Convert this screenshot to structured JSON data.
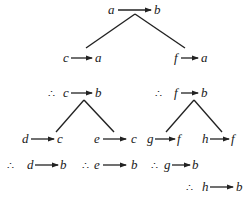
{
  "diagram": {
    "type": "inference-tree",
    "therefore_symbol": "∴",
    "nodes": [
      {
        "id": "root",
        "from": "a",
        "to": "b",
        "x": 118,
        "y": 14
      },
      {
        "id": "c_a",
        "from": "c",
        "to": "a",
        "x": 63,
        "y": 62
      },
      {
        "id": "f_a",
        "from": "f",
        "to": "a",
        "x": 174,
        "y": 62
      },
      {
        "id": "c_b",
        "from": "c",
        "to": "b",
        "x": 64,
        "y": 96,
        "therefore": true
      },
      {
        "id": "f_b",
        "from": "f",
        "to": "b",
        "x": 174,
        "y": 96,
        "therefore": true
      },
      {
        "id": "d_c",
        "from": "d",
        "to": "c",
        "x": 24,
        "y": 141
      },
      {
        "id": "e_c",
        "from": "e",
        "to": "c",
        "x": 93,
        "y": 141
      },
      {
        "id": "g_f",
        "from": "g",
        "to": "f",
        "x": 148,
        "y": 141
      },
      {
        "id": "h_f",
        "from": "h",
        "to": "f",
        "x": 203,
        "y": 141
      },
      {
        "id": "d_b",
        "from": "d",
        "to": "b",
        "x": 28,
        "y": 167,
        "therefore": true
      },
      {
        "id": "e_b",
        "from": "e",
        "to": "b",
        "x": 96,
        "y": 167,
        "therefore": true
      },
      {
        "id": "g_b",
        "from": "g",
        "to": "b",
        "x": 168,
        "y": 167,
        "therefore": true
      },
      {
        "id": "h_b",
        "from": "h",
        "to": "b",
        "x": 200,
        "y": 190,
        "therefore": true
      }
    ],
    "edges": [
      {
        "from": "root",
        "to": "c_a"
      },
      {
        "from": "root",
        "to": "f_a"
      },
      {
        "from": "c_b",
        "to": "d_c"
      },
      {
        "from": "c_b",
        "to": "e_c"
      },
      {
        "from": "f_b",
        "to": "g_f"
      },
      {
        "from": "f_b",
        "to": "h_f"
      }
    ]
  },
  "labels": {
    "root_from": "a",
    "root_to": "b",
    "ca_from": "c",
    "ca_to": "a",
    "fa_from": "f",
    "fa_to": "a",
    "cb_from": "c",
    "cb_to": "b",
    "fb_from": "f",
    "fb_to": "b",
    "dc_from": "d",
    "dc_to": "c",
    "ec_from": "e",
    "ec_to": "c",
    "gf_from": "g",
    "gf_to": "f",
    "hf_from": "h",
    "hf_to": "f",
    "db_from": "d",
    "db_to": "b",
    "eb_from": "e",
    "eb_to": "b",
    "gb_from": "g",
    "gb_to": "b",
    "hb_from": "h",
    "hb_to": "b",
    "therefore": "∴"
  }
}
